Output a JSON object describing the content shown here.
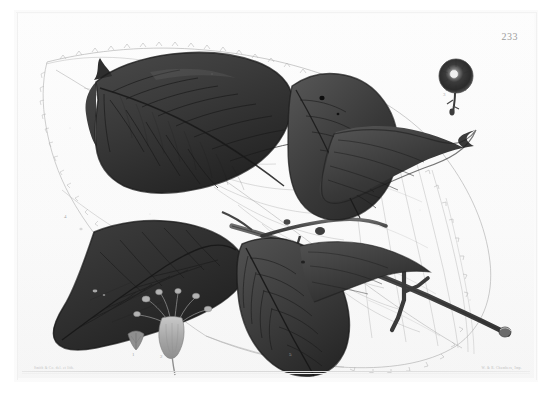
{
  "plate": {
    "number": "233",
    "credit_left": "Smith & Co. del. et lith.",
    "credit_right": "W. & R. Chambers, Imp."
  },
  "figure_labels": {
    "fig1": "1",
    "fig2": "2",
    "fig3": "3",
    "fig4": "4",
    "fig5": "5"
  },
  "colors": {
    "paper": "#fbfbfb",
    "ink_dark": "#2e2e2e",
    "ink_mid": "#4a4a4a",
    "ink_faint": "#b9b9b9",
    "plate_number": "#9c9c9c"
  },
  "illustration": {
    "title": "Botanical plate engraving",
    "subjects": [
      "dark-washed leaf upper-left",
      "dark-washed leaf upper-right",
      "dark-washed leaf lower-left",
      "dark-washed leaf lower-center",
      "faint outline leaf background",
      "woody branch with stipule",
      "flower cluster detail",
      "fruit head detail",
      "bract detail"
    ]
  }
}
